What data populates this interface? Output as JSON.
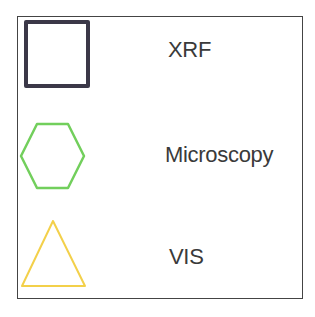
{
  "legend": {
    "frame_color": "#444444",
    "text_color": "#3a3a3a",
    "items": [
      {
        "label": "XRF",
        "shape": "square",
        "color": "#3b3848"
      },
      {
        "label": "Microscopy",
        "shape": "hexagon",
        "color": "#72cf5c"
      },
      {
        "label": "VIS",
        "shape": "triangle",
        "color": "#f3d04a"
      }
    ]
  }
}
